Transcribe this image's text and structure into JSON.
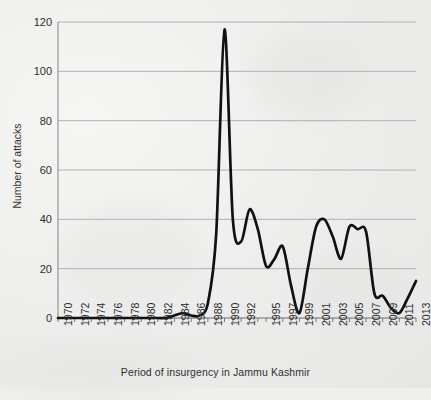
{
  "chart_data": {
    "type": "line",
    "title": "",
    "xlabel": "Period of insurgency in Jammu  Kashmir",
    "ylabel": "Number of attacks",
    "ylim": [
      0,
      120
    ],
    "ytick_values": [
      0,
      20,
      40,
      60,
      80,
      100,
      120
    ],
    "grid": true,
    "legend": "none",
    "line_color": "#111111",
    "x": [
      1970,
      1971,
      1972,
      1973,
      1974,
      1975,
      1976,
      1977,
      1978,
      1979,
      1980,
      1981,
      1982,
      1983,
      1984,
      1985,
      1986,
      1987,
      1988,
      1989,
      1990,
      1991,
      1992,
      1993,
      1994,
      1995,
      1996,
      1997,
      1998,
      1999,
      2000,
      2001,
      2002,
      2003,
      2004,
      2005,
      2006,
      2007,
      2008,
      2009,
      2010,
      2011,
      2012,
      2013
    ],
    "values": [
      0,
      0,
      0,
      0,
      0,
      0,
      0,
      0,
      0,
      0,
      0,
      0,
      0,
      0,
      1,
      2,
      1,
      1,
      6,
      34,
      117,
      40,
      31,
      44,
      36,
      21,
      24,
      29,
      13,
      2,
      20,
      37,
      40,
      33,
      24,
      37,
      36,
      35,
      10,
      9,
      4,
      2,
      8,
      15
    ],
    "xtick_labels": [
      "1970",
      "1972",
      "1974",
      "1976",
      "1978",
      "1980",
      "1982",
      "1984",
      "1986",
      "1988",
      "1990",
      "1992",
      "1995",
      "1997",
      "1999",
      "2001",
      "2003",
      "2005",
      "2007",
      "2009",
      "2011",
      "2013"
    ],
    "xtick_positions": [
      1970,
      1972,
      1974,
      1976,
      1978,
      1980,
      1982,
      1984,
      1986,
      1988,
      1990,
      1992,
      1995,
      1997,
      1999,
      2001,
      2003,
      2005,
      2007,
      2009,
      2011,
      2013
    ],
    "annotations": []
  }
}
